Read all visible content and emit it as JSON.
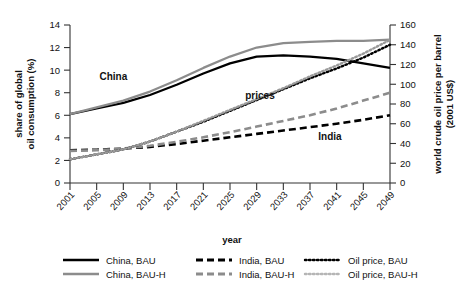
{
  "chart_data": {
    "type": "line",
    "title": "",
    "xlabel": "year",
    "ylabel": "share of global oil consumption (%)",
    "y2label": "world crude oil price per barrel (2001 US$)",
    "ylabel_line1": "share of global",
    "ylabel_line2": "oil consumption (%)",
    "y2label_line1": "world crude oil price per barrel",
    "y2label_line2": "(2001 US$)",
    "grid": false,
    "legend_position": "bottom",
    "xlim": [
      2001,
      2049
    ],
    "ylim": [
      0,
      14
    ],
    "y2lim": [
      0,
      160
    ],
    "yticks": [
      0,
      2,
      4,
      6,
      8,
      10,
      12,
      14
    ],
    "y2ticks": [
      0,
      20,
      40,
      60,
      80,
      100,
      120,
      140,
      160
    ],
    "categories": [
      2001,
      2005,
      2009,
      2013,
      2017,
      2021,
      2025,
      2029,
      2033,
      2037,
      2041,
      2045,
      2049
    ],
    "xtick_labels": [
      "2001",
      "2005",
      "2009",
      "2013",
      "2017",
      "2021",
      "2025",
      "2029",
      "2033",
      "2037",
      "2041",
      "2045",
      "2049"
    ],
    "series": [
      {
        "name": "China, BAU",
        "axis": "left",
        "style": "solid",
        "color": "#000000",
        "values": [
          6.1,
          6.6,
          7.1,
          7.8,
          8.7,
          9.7,
          10.6,
          11.2,
          11.3,
          11.2,
          11.0,
          10.6,
          10.2
        ]
      },
      {
        "name": "China, BAU-H",
        "axis": "left",
        "style": "solid",
        "color": "#8c8c8c",
        "values": [
          6.1,
          6.7,
          7.3,
          8.1,
          9.1,
          10.2,
          11.2,
          12.0,
          12.4,
          12.5,
          12.6,
          12.6,
          12.7
        ]
      },
      {
        "name": "India, BAU",
        "axis": "left",
        "style": "dashed",
        "color": "#000000",
        "values": [
          2.9,
          2.95,
          3.05,
          3.2,
          3.45,
          3.75,
          4.05,
          4.35,
          4.65,
          4.95,
          5.25,
          5.6,
          6.0
        ]
      },
      {
        "name": "India, BAU-H",
        "axis": "left",
        "style": "dashed",
        "color": "#8c8c8c",
        "values": [
          2.85,
          2.9,
          3.05,
          3.3,
          3.65,
          4.05,
          4.5,
          5.0,
          5.5,
          6.0,
          6.6,
          7.3,
          8.0
        ]
      },
      {
        "name": "Oil price, BAU",
        "axis": "right",
        "style": "dotted",
        "color": "#000000",
        "values": [
          24,
          29,
          34,
          42,
          52,
          62,
          73,
          84,
          95,
          106,
          116,
          127,
          140
        ]
      },
      {
        "name": "Oil price, BAU-H",
        "axis": "right",
        "style": "dotted",
        "color": "#9a9a9a",
        "values": [
          24,
          29,
          34,
          42,
          52,
          63,
          74,
          85,
          96,
          108,
          119,
          131,
          145
        ]
      }
    ],
    "annotations": [
      {
        "text": "China",
        "x": 2007.5,
        "y": 9.1
      },
      {
        "text": "prices",
        "x": 2029.5,
        "y": 7.4
      },
      {
        "text": "India",
        "x": 2040.0,
        "y": 3.8
      }
    ],
    "legend": [
      {
        "label": "China, BAU",
        "style": "solid",
        "color": "#000000"
      },
      {
        "label": "India, BAU",
        "style": "dashed",
        "color": "#000000"
      },
      {
        "label": "Oil price, BAU",
        "style": "dotted",
        "color": "#000000"
      },
      {
        "label": "China, BAU-H",
        "style": "solid",
        "color": "#8c8c8c"
      },
      {
        "label": "India, BAU-H",
        "style": "dashed",
        "color": "#8c8c8c"
      },
      {
        "label": "Oil price, BAU-H",
        "style": "dotted",
        "color": "#b5b5b5"
      }
    ]
  }
}
